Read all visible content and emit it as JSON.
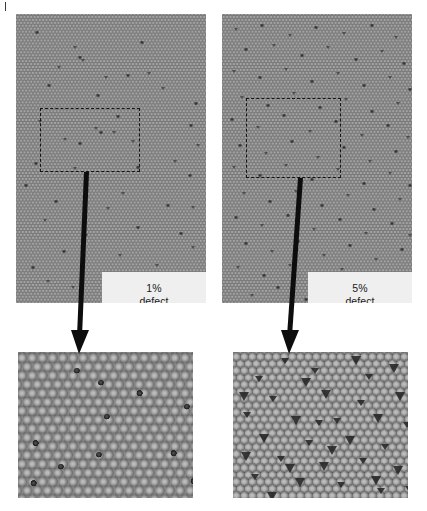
{
  "figure": {
    "background_color": "#ffffff",
    "lattice_color": "#8d8d8d",
    "defect_color": "#2c2c2c",
    "label_box_color": "#efefef",
    "annotation_color": "#141414"
  },
  "corner_mark": {
    "name": "panel-letter-fragment",
    "text": ""
  },
  "panels": [
    {
      "id": "wide-1pct",
      "role": "wide-view",
      "label": {
        "line1": "1%",
        "line2": "defect"
      },
      "defect_percent": 1,
      "selection_box": {
        "shape": "rectangle",
        "style": "dashed"
      },
      "defects": [
        [
          19,
          17
        ],
        [
          57,
          32
        ],
        [
          124,
          27
        ],
        [
          41,
          52
        ],
        [
          62,
          42
        ],
        [
          65,
          45
        ],
        [
          31,
          70
        ],
        [
          88,
          62
        ],
        [
          110,
          60
        ],
        [
          131,
          58
        ],
        [
          80,
          80
        ],
        [
          145,
          73
        ],
        [
          178,
          88
        ],
        [
          22,
          106
        ],
        [
          100,
          101
        ],
        [
          78,
          113
        ],
        [
          83,
          117
        ],
        [
          96,
          117
        ],
        [
          173,
          110
        ],
        [
          47,
          124
        ],
        [
          62,
          128
        ],
        [
          115,
          126
        ],
        [
          18,
          148
        ],
        [
          57,
          153
        ],
        [
          120,
          152
        ],
        [
          157,
          146
        ],
        [
          172,
          160
        ],
        [
          105,
          178
        ],
        [
          38,
          186
        ],
        [
          90,
          193
        ],
        [
          150,
          190
        ],
        [
          27,
          205
        ],
        [
          120,
          212
        ],
        [
          68,
          220
        ],
        [
          163,
          218
        ],
        [
          175,
          232
        ],
        [
          46,
          236
        ],
        [
          102,
          240
        ],
        [
          15,
          252
        ],
        [
          139,
          250
        ],
        [
          86,
          258
        ],
        [
          30,
          266
        ],
        [
          160,
          262
        ],
        [
          55,
          272
        ],
        [
          112,
          274
        ],
        [
          175,
          192
        ],
        [
          8,
          170
        ],
        [
          180,
          130
        ]
      ]
    },
    {
      "id": "wide-5pct",
      "role": "wide-view",
      "label": {
        "line1": "5%",
        "line2": "defect"
      },
      "defect_percent": 5,
      "selection_box": {
        "shape": "square",
        "style": "dashed"
      },
      "defects": [
        [
          12,
          14
        ],
        [
          38,
          10
        ],
        [
          66,
          20
        ],
        [
          92,
          12
        ],
        [
          120,
          18
        ],
        [
          148,
          10
        ],
        [
          172,
          22
        ],
        [
          22,
          34
        ],
        [
          50,
          30
        ],
        [
          78,
          40
        ],
        [
          104,
          32
        ],
        [
          132,
          44
        ],
        [
          158,
          36
        ],
        [
          180,
          48
        ],
        [
          10,
          56
        ],
        [
          36,
          62
        ],
        [
          62,
          54
        ],
        [
          88,
          66
        ],
        [
          114,
          58
        ],
        [
          140,
          70
        ],
        [
          166,
          62
        ],
        [
          186,
          74
        ],
        [
          18,
          82
        ],
        [
          44,
          90
        ],
        [
          70,
          78
        ],
        [
          96,
          92
        ],
        [
          122,
          84
        ],
        [
          148,
          96
        ],
        [
          174,
          88
        ],
        [
          8,
          104
        ],
        [
          34,
          112
        ],
        [
          60,
          100
        ],
        [
          86,
          116
        ],
        [
          112,
          106
        ],
        [
          138,
          120
        ],
        [
          164,
          110
        ],
        [
          184,
          122
        ],
        [
          16,
          130
        ],
        [
          42,
          138
        ],
        [
          68,
          126
        ],
        [
          94,
          142
        ],
        [
          120,
          132
        ],
        [
          146,
          146
        ],
        [
          172,
          136
        ],
        [
          10,
          152
        ],
        [
          36,
          160
        ],
        [
          62,
          150
        ],
        [
          88,
          164
        ],
        [
          114,
          154
        ],
        [
          140,
          168
        ],
        [
          166,
          158
        ],
        [
          186,
          170
        ],
        [
          20,
          178
        ],
        [
          46,
          186
        ],
        [
          72,
          176
        ],
        [
          98,
          190
        ],
        [
          124,
          180
        ],
        [
          150,
          194
        ],
        [
          176,
          184
        ],
        [
          12,
          202
        ],
        [
          38,
          210
        ],
        [
          64,
          200
        ],
        [
          90,
          214
        ],
        [
          116,
          204
        ],
        [
          142,
          218
        ],
        [
          168,
          208
        ],
        [
          186,
          220
        ],
        [
          22,
          228
        ],
        [
          48,
          236
        ],
        [
          74,
          226
        ],
        [
          100,
          240
        ],
        [
          126,
          230
        ],
        [
          152,
          244
        ],
        [
          178,
          234
        ],
        [
          14,
          252
        ],
        [
          40,
          260
        ],
        [
          66,
          250
        ],
        [
          92,
          264
        ],
        [
          118,
          254
        ],
        [
          144,
          268
        ],
        [
          170,
          258
        ],
        [
          54,
          272
        ],
        [
          106,
          276
        ],
        [
          158,
          278
        ],
        [
          28,
          280
        ],
        [
          82,
          284
        ],
        [
          134,
          286
        ]
      ]
    },
    {
      "id": "zoom-1pct",
      "role": "magnified-view",
      "source": "wide-1pct",
      "defects": [
        [
          80,
          28
        ],
        [
          118,
          38
        ],
        [
          86,
          62
        ],
        [
          14,
          88
        ],
        [
          78,
          100
        ],
        [
          152,
          98
        ],
        [
          40,
          112
        ],
        [
          12,
          128
        ],
        [
          166,
          52
        ],
        [
          172,
          126
        ],
        [
          56,
          16
        ]
      ]
    },
    {
      "id": "zoom-5pct",
      "role": "magnified-view",
      "source": "wide-5pct",
      "defects": [
        [
          48,
          6
        ],
        [
          118,
          4
        ],
        [
          22,
          24
        ],
        [
          68,
          26
        ],
        [
          132,
          22
        ],
        [
          156,
          12
        ],
        [
          36,
          44
        ],
        [
          88,
          38
        ],
        [
          124,
          48
        ],
        [
          162,
          40
        ],
        [
          10,
          60
        ],
        [
          58,
          64
        ],
        [
          100,
          66
        ],
        [
          140,
          62
        ],
        [
          170,
          70
        ],
        [
          26,
          82
        ],
        [
          72,
          88
        ],
        [
          112,
          84
        ],
        [
          148,
          92
        ],
        [
          8,
          100
        ],
        [
          44,
          104
        ],
        [
          86,
          110
        ],
        [
          126,
          106
        ],
        [
          160,
          114
        ],
        [
          18,
          122
        ],
        [
          62,
          126
        ],
        [
          104,
          130
        ],
        [
          138,
          124
        ],
        [
          172,
          134
        ],
        [
          34,
          140
        ],
        [
          78,
          16
        ],
        [
          94,
          94
        ],
        [
          82,
          68
        ],
        [
          52,
          112
        ],
        [
          144,
          136
        ],
        [
          6,
          40
        ]
      ]
    }
  ]
}
